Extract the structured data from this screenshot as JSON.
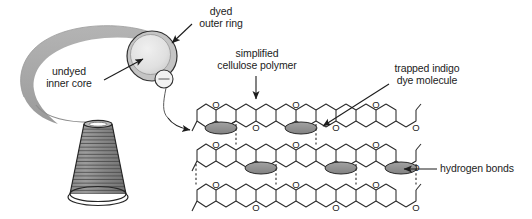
{
  "figure": {
    "background_color": "#ffffff",
    "line_color": "#1c1c1c",
    "yarn_gray": "#a8a8a8",
    "core_gray": "#e2e2e2",
    "ring_gray": "#c9c9c9",
    "dye_ellipse_gray": "#8f8f8f",
    "cone_gray": "#8a8a8a"
  },
  "labels": {
    "dyed_outer_ring": "dyed\nouter ring",
    "undyed_inner_core": "undyed\ninner core",
    "simplified_cellulose_polymer": "simplified\ncellulose polymer",
    "trapped_indigo_dye_molecule": "trapped indigo\ndye molecule",
    "hydrogen_bonds": "hydrogen bonds"
  },
  "icons": {
    "oxygen_atom": "O",
    "yarn_cross_section": "yarn-cross-section",
    "thread_cone": "thread-cone",
    "indigo_dye_ellipse": "indigo-dye-ellipse",
    "hydrogen_bond_dash": "hydrogen-bond-dashed-line"
  },
  "diagram_data": {
    "type": "diagram",
    "yarn_cross_section": {
      "outer_ring_label": "dyed outer ring",
      "inner_core_label": "undyed inner core",
      "center_x": 152,
      "center_y": 56,
      "outer_radius": 25,
      "inner_radius": 20,
      "callout_circle": {
        "cx": 164,
        "cy": 79,
        "r": 9
      }
    },
    "thread_cone": {
      "winding_lines": 22,
      "top_y": 121,
      "bottom_y": 205
    },
    "cellulose_lattice": {
      "rows": 3,
      "hexagons_per_row": 6,
      "oxygen_label": "O",
      "dye_molecules_total": 6,
      "dye_positions": [
        {
          "row": 1,
          "index": 1
        },
        {
          "row": 1,
          "index": 3
        },
        {
          "row": 3,
          "index": 1
        },
        {
          "row": 3,
          "index": 3
        }
      ],
      "hydrogen_bond_style": "vertical dashed lines between chains"
    }
  }
}
